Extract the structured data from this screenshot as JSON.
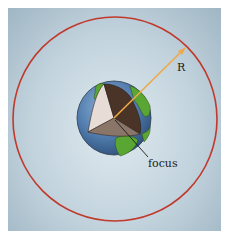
{
  "diagram": {
    "labels": {
      "radius": "R",
      "focus": "focus"
    },
    "colors": {
      "background": "#c2d3dd",
      "orbit": "#c0392b",
      "radius_arrow": "#f0a848",
      "ocean": "#5b86b5",
      "land": "#5aa632",
      "cut_light": "#e8dcd6",
      "cut_dark": "#4a3428",
      "cut_mid": "#8a7668",
      "focus_line": "#1a1a1a"
    },
    "elements": {
      "orbit": "circular orbit",
      "planet": "Earth with cutaway",
      "radius_arrow": "arrow from focus to orbit",
      "focus_pointer": "line to focus"
    }
  }
}
